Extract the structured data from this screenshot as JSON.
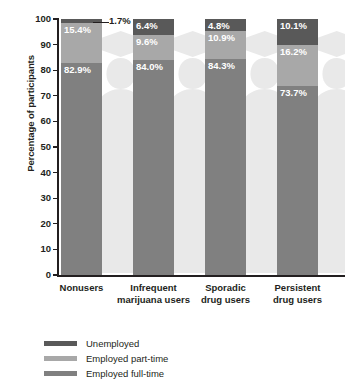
{
  "chart_data": {
    "type": "bar",
    "variant": "stacked-100",
    "title": "",
    "xlabel": "",
    "ylabel": "Percentage of participants",
    "ylim": [
      0,
      100
    ],
    "y_ticks": [
      0,
      10,
      20,
      30,
      40,
      50,
      60,
      70,
      80,
      90,
      100
    ],
    "grid": false,
    "legend_position": "bottom-left",
    "categories": [
      "Nonusers",
      "Infrequent marijuana users",
      "Sporadic drug users",
      "Persistent drug users"
    ],
    "category_lines": [
      [
        "Nonusers"
      ],
      [
        "Infrequent",
        "marijuana users"
      ],
      [
        "Sporadic",
        "drug users"
      ],
      [
        "Persistent",
        "drug users"
      ]
    ],
    "series": [
      {
        "name": "Unemployed",
        "color": "#595959",
        "values": [
          1.7,
          6.4,
          4.8,
          10.1
        ],
        "labels": [
          "1.7%",
          "6.4%",
          "4.8%",
          "10.1%"
        ]
      },
      {
        "name": "Employed part-time",
        "color": "#a8a8a8",
        "values": [
          15.4,
          9.6,
          10.9,
          16.2
        ],
        "labels": [
          "15.4%",
          "9.6%",
          "10.9%",
          "16.2%"
        ]
      },
      {
        "name": "Employed full-time",
        "color": "#808080",
        "values": [
          82.9,
          84.0,
          84.3,
          73.7
        ],
        "labels": [
          "82.9%",
          "84.0%",
          "84.3%",
          "73.7%"
        ]
      }
    ]
  },
  "axis": {
    "y_title": "Percentage of participants",
    "y_tick_labels": [
      "100",
      "90",
      "80",
      "70",
      "60",
      "50",
      "40",
      "30",
      "20",
      "10",
      "0"
    ]
  },
  "legend": {
    "items": [
      {
        "label": "Unemployed",
        "color": "#595959"
      },
      {
        "label": "Employed part-time",
        "color": "#a8a8a8"
      },
      {
        "label": "Employed full-time",
        "color": "#808080"
      }
    ]
  },
  "colors": {
    "unemployed": "#595959",
    "part_time": "#a8a8a8",
    "full_time": "#808080",
    "axis": "#231f20",
    "watermark": "#e8e8e8",
    "background": "#ffffff"
  },
  "watermark": {
    "name": "graduate-silhouette",
    "count": 4
  }
}
